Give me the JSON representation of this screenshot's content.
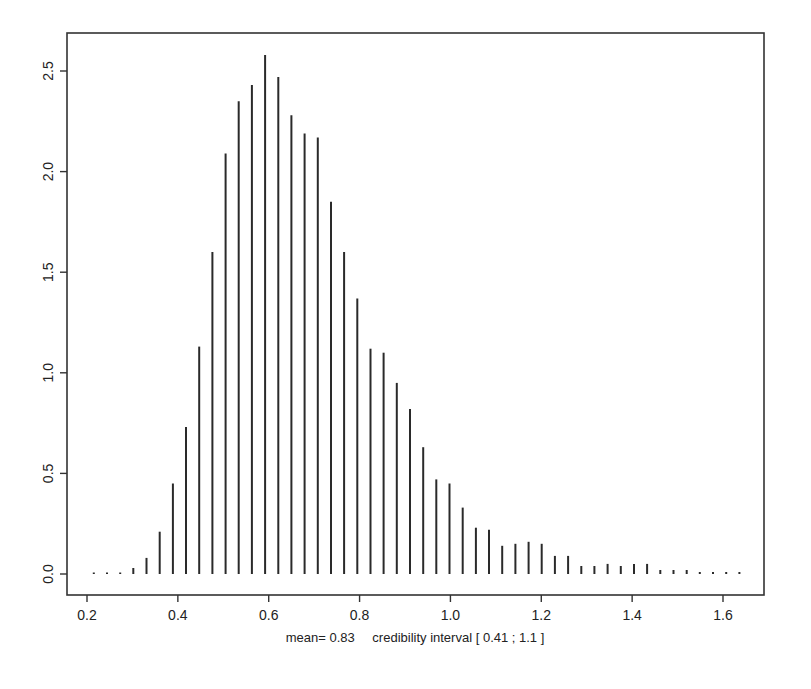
{
  "chart_data": {
    "type": "bar",
    "style": "spike",
    "title": "",
    "xlabel": "",
    "ylabel": "",
    "caption": {
      "mean_label": "mean=",
      "mean_value": "0.83",
      "interval_label": "credibility interval",
      "interval_text": "[ 0.41  ;  1.1 ]"
    },
    "xlim": [
      0.17,
      1.71
    ],
    "ylim": [
      -0.1,
      2.68
    ],
    "x_ticks": [
      0.2,
      0.4,
      0.6,
      0.8,
      1.0,
      1.2,
      1.4,
      1.6
    ],
    "x_tick_labels": [
      "0.2",
      "0.4",
      "0.6",
      "0.8",
      "1.0",
      "1.2",
      "1.4",
      "1.6"
    ],
    "y_ticks": [
      0.0,
      0.5,
      1.0,
      1.5,
      2.0,
      2.5
    ],
    "y_tick_labels": [
      "0.0",
      "0.5",
      "1.0",
      "1.5",
      "2.0",
      "2.5"
    ],
    "grid": false,
    "legend": "none",
    "x": [
      0.215,
      0.244,
      0.273,
      0.302,
      0.331,
      0.36,
      0.389,
      0.418,
      0.447,
      0.476,
      0.505,
      0.534,
      0.563,
      0.592,
      0.621,
      0.65,
      0.679,
      0.708,
      0.737,
      0.766,
      0.795,
      0.824,
      0.853,
      0.882,
      0.911,
      0.94,
      0.969,
      0.998,
      1.027,
      1.056,
      1.085,
      1.114,
      1.143,
      1.172,
      1.201,
      1.23,
      1.259,
      1.288,
      1.317,
      1.346,
      1.375,
      1.404,
      1.433,
      1.462,
      1.491,
      1.52,
      1.549,
      1.578,
      1.607,
      1.636
    ],
    "values": [
      0.0,
      0.0,
      0.0,
      0.03,
      0.08,
      0.21,
      0.45,
      0.73,
      1.13,
      1.6,
      2.09,
      2.35,
      2.43,
      2.58,
      2.47,
      2.28,
      2.19,
      2.17,
      1.85,
      1.6,
      1.37,
      1.12,
      1.1,
      0.95,
      0.82,
      0.63,
      0.47,
      0.45,
      0.33,
      0.23,
      0.22,
      0.14,
      0.15,
      0.16,
      0.15,
      0.09,
      0.09,
      0.04,
      0.04,
      0.05,
      0.04,
      0.05,
      0.05,
      0.02,
      0.02,
      0.02,
      0.01,
      0.01,
      0.01,
      0.01
    ]
  }
}
